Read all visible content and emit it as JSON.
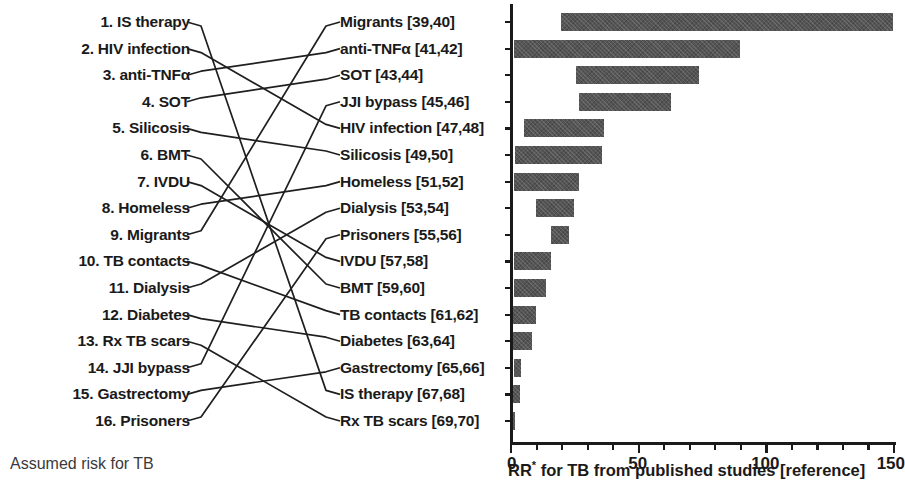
{
  "figure": {
    "left_caption": "Assumed risk for TB",
    "right_caption_prefix": "RR",
    "right_caption_star": "*",
    "right_caption_suffix": " for TB from published studies [reference]"
  },
  "left_column": {
    "items": [
      {
        "rank": "1.",
        "label": "IS therapy"
      },
      {
        "rank": "2.",
        "label": "HIV infection"
      },
      {
        "rank": "3.",
        "label": "anti-TNFα"
      },
      {
        "rank": "4.",
        "label": "SOT"
      },
      {
        "rank": "5.",
        "label": "Silicosis"
      },
      {
        "rank": "6.",
        "label": "BMT"
      },
      {
        "rank": "7.",
        "label": "IVDU"
      },
      {
        "rank": "8.",
        "label": "Homeless"
      },
      {
        "rank": "9.",
        "label": "Migrants"
      },
      {
        "rank": "10.",
        "label": "TB contacts"
      },
      {
        "rank": "11.",
        "label": "Dialysis"
      },
      {
        "rank": "12.",
        "label": "Diabetes"
      },
      {
        "rank": "13.",
        "label": "Rx TB scars"
      },
      {
        "rank": "14.",
        "label": "JJI bypass"
      },
      {
        "rank": "15.",
        "label": "Gastrectomy"
      },
      {
        "rank": "16.",
        "label": "Prisoners"
      }
    ]
  },
  "middle_column": {
    "items": [
      {
        "label": "Migrants",
        "refs": "[39,40]"
      },
      {
        "label": "anti-TNFα",
        "refs": "[41,42]"
      },
      {
        "label": "SOT",
        "refs": "[43,44]"
      },
      {
        "label": "JJI bypass",
        "refs": "[45,46]"
      },
      {
        "label": "HIV infection",
        "refs": "[47,48]"
      },
      {
        "label": "Silicosis",
        "refs": "[49,50]"
      },
      {
        "label": "Homeless",
        "refs": "[51,52]"
      },
      {
        "label": "Dialysis",
        "refs": "[53,54]"
      },
      {
        "label": "Prisoners",
        "refs": "[55,56]"
      },
      {
        "label": "IVDU",
        "refs": "[57,58]"
      },
      {
        "label": "BMT",
        "refs": "[59,60]"
      },
      {
        "label": "TB contacts",
        "refs": "[61,62]"
      },
      {
        "label": "Diabetes",
        "refs": "[63,64]"
      },
      {
        "label": "Gastrectomy",
        "refs": "[65,66]"
      },
      {
        "label": "IS therapy",
        "refs": "[67,68]"
      },
      {
        "label": "Rx TB scars",
        "refs": "[69,70]"
      }
    ]
  },
  "connections": [
    {
      "from": 0,
      "to": 14
    },
    {
      "from": 1,
      "to": 4
    },
    {
      "from": 2,
      "to": 1
    },
    {
      "from": 3,
      "to": 2
    },
    {
      "from": 4,
      "to": 5
    },
    {
      "from": 5,
      "to": 10
    },
    {
      "from": 6,
      "to": 9
    },
    {
      "from": 7,
      "to": 6
    },
    {
      "from": 8,
      "to": 0
    },
    {
      "from": 9,
      "to": 11
    },
    {
      "from": 10,
      "to": 7
    },
    {
      "from": 11,
      "to": 12
    },
    {
      "from": 12,
      "to": 15
    },
    {
      "from": 13,
      "to": 3
    },
    {
      "from": 14,
      "to": 13
    },
    {
      "from": 15,
      "to": 8
    }
  ],
  "chart_data": {
    "type": "bar",
    "orientation": "horizontal",
    "title": "",
    "xlabel": "RR* for TB from published studies [reference]",
    "ylabel": "",
    "xlim": [
      0,
      150
    ],
    "xticks": [
      0,
      50,
      100,
      150
    ],
    "xtick_labels": [
      "0",
      "50",
      "100",
      "150"
    ],
    "minor_tick_interval": 10,
    "grid": false,
    "legend": false,
    "bar_color": "#555555",
    "note": "Each bar spans the low-to-high range of published relative risk (RR) estimates.",
    "categories": [
      "Migrants [39,40]",
      "anti-TNFα [41,42]",
      "SOT [43,44]",
      "JJI bypass [45,46]",
      "HIV infection [47,48]",
      "Silicosis [49,50]",
      "Homeless [51,52]",
      "Dialysis [53,54]",
      "Prisoners [55,56]",
      "IVDU [57,58]",
      "BMT [59,60]",
      "TB contacts [61,62]",
      "Diabetes [63,64]",
      "Gastrectomy [65,66]",
      "IS therapy [67,68]",
      "Rx TB scars [69,70]"
    ],
    "ranges": [
      {
        "category": "Migrants [39,40]",
        "low": 20,
        "high": 150
      },
      {
        "category": "anti-TNFα [41,42]",
        "low": 1.5,
        "high": 90
      },
      {
        "category": "SOT [43,44]",
        "low": 26,
        "high": 74
      },
      {
        "category": "JJI bypass [45,46]",
        "low": 27,
        "high": 63
      },
      {
        "category": "HIV infection [47,48]",
        "low": 5.5,
        "high": 37
      },
      {
        "category": "Silicosis [49,50]",
        "low": 2,
        "high": 36
      },
      {
        "category": "Homeless [51,52]",
        "low": 1.5,
        "high": 27
      },
      {
        "category": "Dialysis [53,54]",
        "low": 10,
        "high": 25
      },
      {
        "category": "Prisoners [55,56]",
        "low": 16,
        "high": 23
      },
      {
        "category": "IVDU [57,58]",
        "low": 1.5,
        "high": 16
      },
      {
        "category": "BMT [59,60]",
        "low": 1.5,
        "high": 14
      },
      {
        "category": "TB contacts [61,62]",
        "low": 1,
        "high": 10
      },
      {
        "category": "Diabetes [63,64]",
        "low": 1,
        "high": 8.5
      },
      {
        "category": "Gastrectomy [65,66]",
        "low": 1.5,
        "high": 4.5
      },
      {
        "category": "IS therapy [67,68]",
        "low": 1,
        "high": 4
      },
      {
        "category": "Rx TB scars [69,70]",
        "low": 1,
        "high": 2
      }
    ]
  }
}
